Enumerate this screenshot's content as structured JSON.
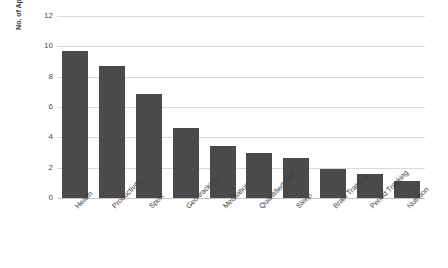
{
  "chart_data": {
    "type": "bar",
    "title": "",
    "subtitle": "",
    "xlabel": "",
    "ylabel": "No. of Applications (in Millions)",
    "categories": [
      "Health",
      "Productivity",
      "Sport",
      "Geo tracking",
      "Meditation",
      "Quantified Self",
      "Sleep",
      "Brain Training",
      "Period Tracking",
      "Nutrition"
    ],
    "values": [
      9.7,
      8.7,
      6.85,
      4.6,
      3.4,
      3.0,
      2.65,
      1.9,
      1.6,
      1.15
    ],
    "ylim": [
      0,
      12
    ],
    "ytick_labels": [
      "0",
      "2",
      "4",
      "6",
      "8",
      "10",
      "12"
    ],
    "ytick_values": [
      0,
      2,
      4,
      6,
      8,
      10,
      12
    ],
    "grid": "horizontal",
    "legend": "none",
    "bar_color": "#4A4A4A",
    "gridline_color": "#D9D9D9",
    "background_color": "#FFFFFF",
    "xlabel_rotation_deg": -45
  }
}
